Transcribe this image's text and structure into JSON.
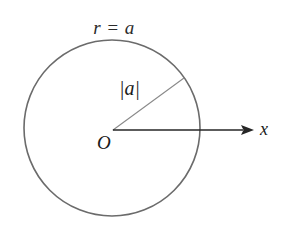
{
  "figure": {
    "type": "geometry-diagram",
    "width": 285,
    "height": 228,
    "background_color": "#ffffff",
    "labels": {
      "equation": "r = a",
      "radius": "|a|",
      "origin": "O",
      "axis_x": "x"
    },
    "colors": {
      "circle_stroke": "#6b6b6b",
      "radius_stroke": "#8a8a8a",
      "axis_stroke": "#262626",
      "text": "#1a1a1a"
    },
    "geometry": {
      "circle": {
        "cx": 112,
        "cy": 128,
        "r": 88,
        "stroke_width": 1.6
      },
      "origin_point": {
        "x": 113,
        "y": 130
      },
      "radius_segment": {
        "x1": 113,
        "y1": 130,
        "x2": 184,
        "y2": 78,
        "stroke_width": 1.1
      },
      "x_axis": {
        "x1": 113,
        "y1": 130,
        "x2": 252,
        "y2": 130,
        "stroke_width": 1.4
      },
      "arrowhead": {
        "tip_x": 254,
        "tip_y": 130,
        "length": 11,
        "half_width": 4.5
      }
    }
  }
}
